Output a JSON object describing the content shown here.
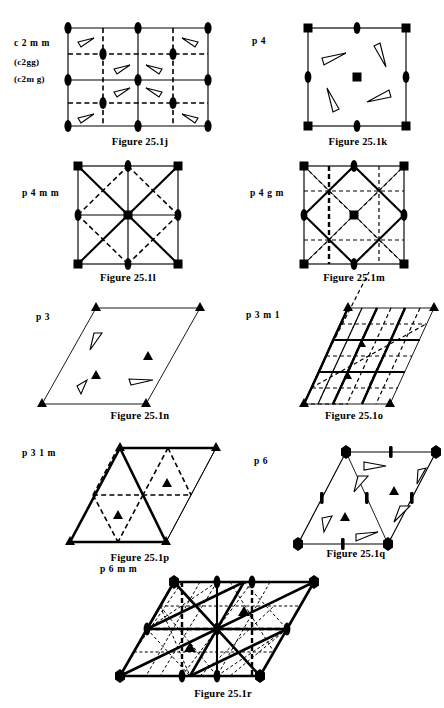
{
  "document": {
    "title": "Plane group symmetry diagrams (Figure 25.1 j-r)"
  },
  "figures": [
    {
      "id": "fig-25-1j",
      "group_label": "c 2 m m",
      "group_alt_labels": [
        "(c2gg)",
        "(c2m g)"
      ],
      "caption": "Figure 25.1j",
      "lattice": "rectangular (centred)",
      "symmetry_elements": [
        "2-fold axes (lens)",
        "mirror lines (solid)",
        "glide lines (dashed)"
      ],
      "motif_count": 8
    },
    {
      "id": "fig-25-1k",
      "group_label": "p 4",
      "caption": "Figure 25.1k",
      "lattice": "square",
      "symmetry_elements": [
        "4-fold axes (filled square)",
        "2-fold axes (lens)"
      ],
      "motif_count": 4
    },
    {
      "id": "fig-25-1l",
      "group_label": "p 4 m m",
      "caption": "Figure 25.1l",
      "lattice": "square",
      "symmetry_elements": [
        "4-fold axes (filled square)",
        "2-fold axes (lens)",
        "mirror lines (solid)",
        "glide lines (dashed)"
      ],
      "motif_count": 0
    },
    {
      "id": "fig-25-1m",
      "group_label": "p 4 g m",
      "caption": "Figure 25.1m",
      "lattice": "square",
      "symmetry_elements": [
        "4-fold axes (filled square)",
        "2-fold axes (lens)",
        "mirror lines (solid)",
        "glide lines (dashed)"
      ],
      "motif_count": 0
    },
    {
      "id": "fig-25-1n",
      "group_label": "p 3",
      "caption": "Figure 25.1n",
      "lattice": "hexagonal (rhombus cell)",
      "symmetry_elements": [
        "3-fold axes (filled triangle)"
      ],
      "motif_count": 3
    },
    {
      "id": "fig-25-1o",
      "group_label": "p 3 m 1",
      "caption": "Figure 25.1o",
      "lattice": "hexagonal (rhombus cell)",
      "symmetry_elements": [
        "3-fold axes (filled triangle)",
        "mirror lines (solid)",
        "glide lines (dashed)"
      ],
      "motif_count": 0
    },
    {
      "id": "fig-25-1p",
      "group_label": "p 3 1 m",
      "caption": "Figure 25.1p",
      "lattice": "hexagonal (rhombus cell)",
      "symmetry_elements": [
        "3-fold axes (filled triangle)",
        "mirror lines (solid)",
        "glide lines (dashed)"
      ],
      "motif_count": 0
    },
    {
      "id": "fig-25-1q",
      "group_label": "p 6",
      "caption": "Figure 25.1q",
      "lattice": "hexagonal (rhombus cell)",
      "symmetry_elements": [
        "6-fold axes (filled hexagon)",
        "3-fold axes (filled triangle)",
        "2-fold axes (lens)"
      ],
      "motif_count": 6
    },
    {
      "id": "fig-25-1r",
      "group_label": "p 6 m m",
      "caption": "Figure 25.1r",
      "lattice": "hexagonal (rhombus cell)",
      "symmetry_elements": [
        "6-fold axes (filled hexagon)",
        "3-fold axes (filled triangle)",
        "2-fold axes (lens)",
        "mirror lines (solid)",
        "glide lines (dashed)"
      ],
      "motif_count": 0
    }
  ],
  "colors": {
    "ink": "#000000",
    "paper": "#ffffff"
  }
}
